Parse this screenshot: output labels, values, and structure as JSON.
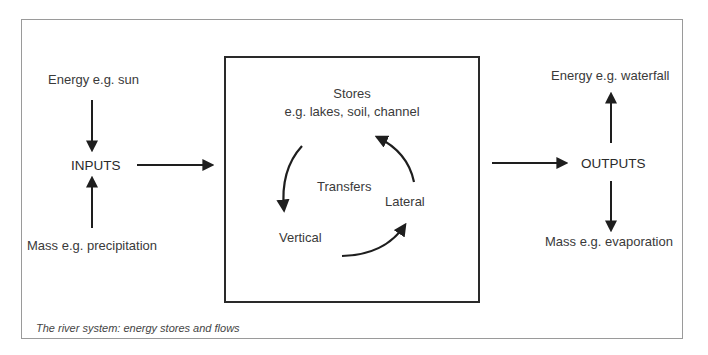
{
  "diagram": {
    "title": "The river system: energy stores and flows",
    "inputs": {
      "label": "INPUTS",
      "energy": "Energy e.g. sun",
      "mass": "Mass e.g. precipitation"
    },
    "system": {
      "stores_title": "Stores",
      "stores_examples": "e.g. lakes, soil, channel",
      "transfers_label": "Transfers",
      "vertical_label": "Vertical",
      "lateral_label": "Lateral"
    },
    "outputs": {
      "label": "OUTPUTS",
      "energy": "Energy e.g. waterfall",
      "mass": "Mass e.g. evaporation"
    },
    "colors": {
      "frame": "#9a9a9a",
      "box": "#2a2a2a",
      "arrow": "#1e1e1e",
      "text": "#3a3a3a"
    }
  }
}
